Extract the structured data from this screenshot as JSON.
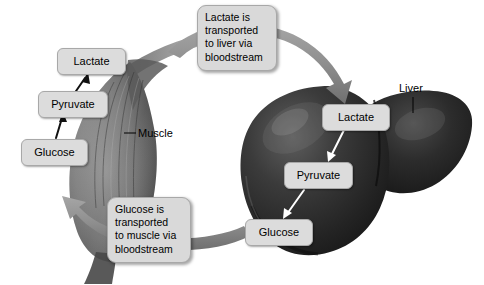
{
  "diagram": {
    "background_color": "#ffffff",
    "label_box_color": "#dcdcdc",
    "callout_box_color": "#d9d9d9",
    "muscle_tissue_color": "#6e6e6e",
    "liver_tissue_color": "#2b2b2b",
    "transport_arrow_color": "#8c8c8c"
  },
  "muscle": {
    "organ_label": "Muscle",
    "steps": [
      {
        "name": "Glucose"
      },
      {
        "name": "Pyruvate"
      },
      {
        "name": "Lactate"
      }
    ],
    "pathway_direction": "upward",
    "arrow_color": "#111111"
  },
  "liver": {
    "organ_label": "Liver",
    "steps": [
      {
        "name": "Lactate"
      },
      {
        "name": "Pyruvate"
      },
      {
        "name": "Glucose"
      }
    ],
    "pathway_direction": "downward",
    "arrow_color": "#ffffff"
  },
  "callouts": {
    "top": {
      "name": "lactate-transport-callout",
      "lines": [
        "Lactate is",
        "transported",
        "to liver via",
        "bloodstream"
      ]
    },
    "bottom": {
      "name": "glucose-transport-callout",
      "lines": [
        "Glucose is",
        "transported",
        "to muscle via",
        "bloodstream"
      ]
    }
  }
}
